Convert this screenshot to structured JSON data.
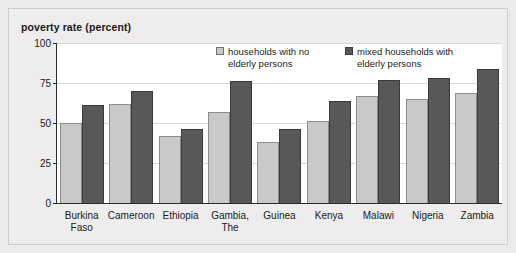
{
  "chart_data": {
    "type": "bar",
    "title": "poverty rate (percent)",
    "xlabel": "",
    "ylabel": "poverty rate (percent)",
    "ylim": [
      0,
      100
    ],
    "yticks": [
      0,
      25,
      50,
      75,
      100
    ],
    "grid": true,
    "legend_position": "top-right-inside",
    "categories": [
      "Burkina\nFaso",
      "Cameroon",
      "Ethiopia",
      "Gambia,\nThe",
      "Guinea",
      "Kenya",
      "Malawi",
      "Nigeria",
      "Zambia"
    ],
    "series": [
      {
        "name": "households with no elderly persons",
        "color": "#c9c9c9",
        "values": [
          50,
          62,
          42,
          57,
          38,
          51,
          67,
          65,
          69
        ]
      },
      {
        "name": "mixed households with elderly persons",
        "color": "#585858",
        "values": [
          61,
          70,
          46,
          76,
          46,
          64,
          77,
          78,
          84
        ]
      }
    ]
  },
  "legend": {
    "entries": [
      {
        "label": "households with no elderly persons",
        "swatch": "light"
      },
      {
        "label": "mixed households with elderly persons",
        "swatch": "dark"
      }
    ]
  }
}
